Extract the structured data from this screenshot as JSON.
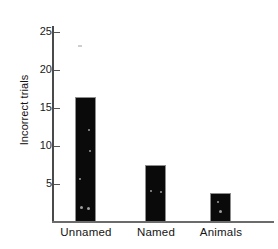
{
  "chart_data": {
    "type": "bar",
    "title": "",
    "subtitle": "",
    "xlabel": "",
    "ylabel": "Incorrect trials",
    "categories": [
      "Unnamed",
      "Named",
      "Animals"
    ],
    "values": [
      16.4,
      7.5,
      3.8
    ],
    "series": [
      {
        "name": "Incorrect trials",
        "values": [
          16.4,
          7.5,
          3.8
        ]
      }
    ],
    "ylim": [
      0,
      27
    ],
    "yticks": [
      5,
      10,
      15,
      20,
      25
    ],
    "ytick_labels": [
      "5",
      "10",
      "15",
      "20",
      "25"
    ],
    "grid": false,
    "legend": false,
    "legend_position": "none",
    "bar_color": "#0a0a0a",
    "bar_edge_color": "#8d8d8d",
    "axis_color": "#4a4a4a",
    "text_color": "#141414",
    "background": "#ffffff"
  }
}
